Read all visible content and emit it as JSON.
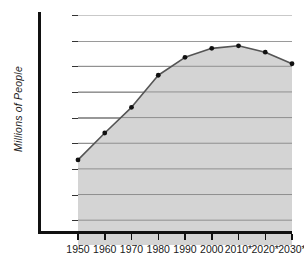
{
  "chart_data": {
    "type": "area",
    "title": "",
    "subtitle": "",
    "xlabel": "",
    "ylabel": "Millions of People",
    "categories": [
      "1950",
      "1960",
      "1970",
      "1980",
      "1990",
      "2000",
      "2010*",
      "2020*",
      "2030*"
    ],
    "values": [
      83.5,
      94,
      104,
      116.5,
      123.5,
      127,
      128,
      125.5,
      121
    ],
    "series": [
      {
        "name": "Population",
        "values": [
          83.5,
          94,
          104,
          116.5,
          123.5,
          127,
          128,
          125.5,
          121
        ]
      }
    ],
    "ylim": [
      55,
      140
    ],
    "xlim": [
      "1950",
      "2030*"
    ],
    "y_ticks": [
      140,
      130,
      120,
      110,
      100,
      90,
      80,
      70,
      60
    ],
    "y_tick_labels": [
      "140",
      "130",
      "120",
      "110",
      "100",
      "90",
      "80",
      "70",
      "60"
    ],
    "x_tick_labels": [
      "1950",
      "1960",
      "1970",
      "1980",
      "1990",
      "2000",
      "2010*",
      "2020*",
      "2030*"
    ],
    "grid": true,
    "grid_axis": "y",
    "legend": false,
    "legend_position": "none",
    "annotations": [
      "* indicates projected values"
    ],
    "colors": {
      "fill": "#d4d4d4",
      "line": "#555555",
      "marker": "#111111",
      "gridline": "#9a9a9a",
      "axis": "#111111",
      "text": "#1a1a1a",
      "background": "#ffffff"
    }
  }
}
